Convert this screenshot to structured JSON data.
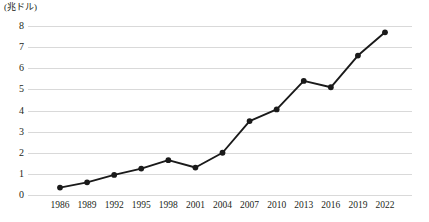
{
  "chart_data": {
    "type": "line",
    "title": "",
    "subtitle": "",
    "xlabel": "",
    "ylabel": "(兆ドル)",
    "unit_label": "(兆ドル)",
    "categories": [
      "1986",
      "1989",
      "1992",
      "1995",
      "1998",
      "2001",
      "2004",
      "2007",
      "2010",
      "2013",
      "2016",
      "2019",
      "2022"
    ],
    "x": [
      1986,
      1989,
      1992,
      1995,
      1998,
      2001,
      2004,
      2007,
      2010,
      2013,
      2016,
      2019,
      2022
    ],
    "values": [
      0.35,
      0.6,
      0.95,
      1.25,
      1.65,
      1.3,
      2.0,
      3.5,
      4.05,
      5.4,
      5.1,
      6.6,
      7.7
    ],
    "series": [
      {
        "name": "",
        "values": [
          0.35,
          0.6,
          0.95,
          1.25,
          1.65,
          1.3,
          2.0,
          3.5,
          4.05,
          5.4,
          5.1,
          6.6,
          7.7
        ]
      }
    ],
    "ylim": [
      0,
      8
    ],
    "yticks": [
      0,
      1,
      2,
      3,
      4,
      5,
      6,
      7,
      8
    ],
    "ytick_labels": [
      "0",
      "1",
      "2",
      "3",
      "4",
      "5",
      "6",
      "7",
      "8"
    ],
    "grid": true,
    "grid_axis": "y",
    "legend": false,
    "legend_position": "none",
    "marker": "circle",
    "colors": {
      "line": "#1a1a1a",
      "marker": "#1a1a1a",
      "gridline": "#d9d9d9",
      "text": "#231f20",
      "background": "#ffffff"
    }
  }
}
